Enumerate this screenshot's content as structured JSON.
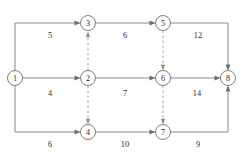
{
  "diagram": {
    "colors": {
      "solid_edge": "#7d7d7d",
      "dashed_edge": "#9a9a9a",
      "node_stroke": "#6f6f6f",
      "node_fill": "#ffffff",
      "text": "#2b2b2b",
      "background": "#ffffff"
    },
    "nodes": [
      {
        "id": "n1",
        "label": "1",
        "cx": 15,
        "cy": 78,
        "r": 7.5
      },
      {
        "id": "n2",
        "label": "2",
        "cx": 88,
        "cy": 78,
        "r": 7.5
      },
      {
        "id": "n3",
        "label": "3",
        "cx": 88,
        "cy": 23,
        "r": 7.5
      },
      {
        "id": "n4",
        "label": "4",
        "cx": 88,
        "cy": 132,
        "r": 7.5
      },
      {
        "id": "n5",
        "label": "5",
        "cx": 163,
        "cy": 23,
        "r": 7.5
      },
      {
        "id": "n6",
        "label": "6",
        "cx": 163,
        "cy": 78,
        "r": 7.5
      },
      {
        "id": "n7",
        "label": "7",
        "cx": 163,
        "cy": 132,
        "r": 7.5
      },
      {
        "id": "n8",
        "label": "8",
        "cx": 228,
        "cy": 78,
        "r": 7.5
      }
    ],
    "edges": [
      {
        "id": "e1-3",
        "from": "1",
        "to": "3",
        "style": "solid",
        "weight": "5",
        "label_x": 50,
        "label_y": 35
      },
      {
        "id": "e3-5",
        "from": "3",
        "to": "5",
        "style": "solid",
        "weight": "6",
        "label_x": 125,
        "label_y": 35
      },
      {
        "id": "e5-8",
        "from": "5",
        "to": "8",
        "style": "solid",
        "weight": "12",
        "label_x": 198,
        "label_y": 35
      },
      {
        "id": "e1-2",
        "from": "1",
        "to": "2",
        "style": "solid",
        "weight": "4",
        "label_x": 50,
        "label_y": 93
      },
      {
        "id": "e2-6",
        "from": "2",
        "to": "6",
        "style": "solid",
        "weight": "7",
        "label_x": 125,
        "label_y": 93
      },
      {
        "id": "e6-8",
        "from": "6",
        "to": "8",
        "style": "solid",
        "weight": "14",
        "label_x": 197,
        "label_y": 93
      },
      {
        "id": "e1-4",
        "from": "1",
        "to": "4",
        "style": "solid",
        "weight": "6",
        "label_x": 50,
        "label_y": 144
      },
      {
        "id": "e4-7",
        "from": "4",
        "to": "7",
        "style": "solid",
        "weight": "10",
        "label_x": 125,
        "label_y": 144
      },
      {
        "id": "e7-8",
        "from": "7",
        "to": "8",
        "style": "solid",
        "weight": "9",
        "label_x": 198,
        "label_y": 144
      },
      {
        "id": "e2-3",
        "from": "2",
        "to": "3",
        "style": "dashed",
        "weight": "",
        "label_x": 0,
        "label_y": 0
      },
      {
        "id": "e2-4",
        "from": "2",
        "to": "4",
        "style": "dashed",
        "weight": "",
        "label_x": 0,
        "label_y": 0
      },
      {
        "id": "e5-6",
        "from": "5",
        "to": "6",
        "style": "dashed",
        "weight": "",
        "label_x": 0,
        "label_y": 0
      },
      {
        "id": "e6-7",
        "from": "6",
        "to": "7",
        "style": "dashed",
        "weight": "",
        "label_x": 0,
        "label_y": 0
      }
    ]
  }
}
